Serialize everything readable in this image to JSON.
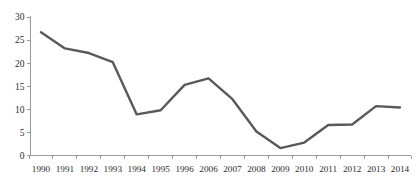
{
  "chart_data": {
    "type": "line",
    "title": "",
    "subtitle": "",
    "xlabel": "",
    "ylabel": "",
    "categories": [
      "1990",
      "1991",
      "1992",
      "1993",
      "1994",
      "1995",
      "1996",
      "2006",
      "2007",
      "2008",
      "2009",
      "2010",
      "2011",
      "2012",
      "2013",
      "2014"
    ],
    "series": [
      {
        "name": "series-1",
        "color": "#595959",
        "values": [
          26.7,
          23.2,
          22.2,
          20.2,
          8.9,
          9.8,
          15.3,
          16.7,
          12.2,
          5.2,
          1.6,
          2.8,
          6.6,
          6.7,
          10.7,
          10.4
        ]
      }
    ],
    "ylim": [
      0,
      30
    ],
    "yticks": [
      0,
      5,
      10,
      15,
      20,
      25,
      30
    ],
    "ytick_labels": [
      "0",
      "5",
      "10",
      "15",
      "20",
      "25",
      "30"
    ],
    "xtick_labels": [
      "1990",
      "1991",
      "1992",
      "1993",
      "1994",
      "1995",
      "1996",
      "2006",
      "2007",
      "2008",
      "2009",
      "2010",
      "2011",
      "2012",
      "2013",
      "2014"
    ],
    "grid": false,
    "legend": "none",
    "annotations": []
  },
  "axes": {
    "axis_color": "#9a9a9a",
    "tick_color": "#9a9a9a",
    "label_color": "#2b2b2b",
    "background": "#ffffff"
  }
}
